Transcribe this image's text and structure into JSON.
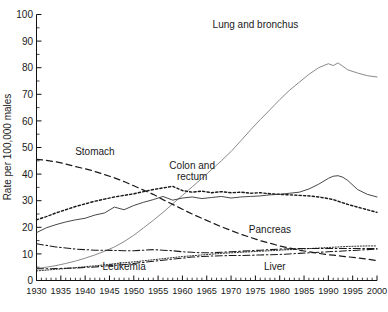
{
  "chart_data": {
    "type": "line",
    "title": "",
    "xlabel": "",
    "ylabel": "Rate per 100,000 males",
    "xlim": [
      1930,
      2000
    ],
    "ylim": [
      0,
      100
    ],
    "ytick_values": [
      0,
      10,
      20,
      30,
      40,
      50,
      60,
      70,
      80,
      90,
      100
    ],
    "ytick_labels": [
      "0",
      "10",
      "20",
      "30",
      "40",
      "50",
      "60",
      "70",
      "80",
      "90",
      "100"
    ],
    "xtick_values": [
      1930,
      1935,
      1940,
      1945,
      1950,
      1955,
      1960,
      1965,
      1970,
      1975,
      1980,
      1985,
      1990,
      1995,
      2000
    ],
    "xtick_labels": [
      "1930",
      "1935",
      "1940",
      "1945",
      "1950",
      "1955",
      "1960",
      "1965",
      "1970",
      "1975",
      "1980",
      "1985",
      "1990",
      "1995",
      "2000"
    ],
    "minor_tick_interval": 1,
    "grid": false,
    "legend": "inline-annotations",
    "x": [
      1930,
      1932,
      1934,
      1936,
      1938,
      1940,
      1942,
      1944,
      1946,
      1948,
      1950,
      1952,
      1954,
      1956,
      1958,
      1960,
      1962,
      1964,
      1966,
      1968,
      1970,
      1972,
      1974,
      1976,
      1978,
      1980,
      1982,
      1984,
      1986,
      1988,
      1990,
      1991,
      1992,
      1993,
      1994,
      1996,
      1998,
      2000
    ],
    "series": [
      {
        "name": "Lung and bronchus",
        "style": "solid-light",
        "label": "Lung and bronchus",
        "label_x": 1975,
        "label_y": 95,
        "values": [
          4.5,
          5.0,
          5.6,
          6.4,
          7.3,
          8.4,
          9.6,
          11.0,
          12.6,
          14.6,
          17.0,
          19.8,
          22.6,
          25.6,
          28.8,
          32.0,
          35.2,
          38.4,
          41.7,
          45.0,
          48.5,
          52.5,
          56.6,
          60.5,
          64.2,
          68.0,
          71.5,
          74.5,
          77.5,
          80.0,
          81.5,
          80.8,
          81.8,
          80.5,
          79.2,
          78.0,
          77.0,
          76.5
        ]
      },
      {
        "name": "Stomach",
        "style": "dashed",
        "label": "Stomach",
        "label_x": 1942,
        "label_y": 47,
        "values": [
          45.5,
          45.2,
          44.6,
          43.8,
          42.8,
          42.0,
          41.0,
          39.8,
          38.6,
          37.2,
          35.6,
          34.0,
          32.4,
          30.4,
          28.6,
          26.8,
          25.0,
          23.4,
          21.8,
          20.2,
          18.8,
          17.4,
          16.2,
          15.0,
          14.0,
          13.0,
          12.2,
          11.4,
          10.8,
          10.2,
          9.7,
          9.5,
          9.3,
          9.1,
          8.9,
          8.5,
          8.0,
          7.5
        ]
      },
      {
        "name": "Colon and rectum",
        "style": "dotted-thick",
        "label": "Colon and rectum",
        "label_x": 1962,
        "label_y": 42,
        "values": [
          22.8,
          24.0,
          25.4,
          26.6,
          27.8,
          28.8,
          29.8,
          30.6,
          31.4,
          32.0,
          32.6,
          33.4,
          34.2,
          34.8,
          35.4,
          33.8,
          33.2,
          33.6,
          33.0,
          33.4,
          33.0,
          33.2,
          32.8,
          33.0,
          32.6,
          32.4,
          32.2,
          32.0,
          31.8,
          31.4,
          30.8,
          30.4,
          29.8,
          29.2,
          28.6,
          27.6,
          26.6,
          25.6
        ]
      },
      {
        "name": "Prostate",
        "style": "solid-dark",
        "label": "",
        "label_x": null,
        "label_y": null,
        "values": [
          18.0,
          19.8,
          21.0,
          22.0,
          22.8,
          23.4,
          24.6,
          25.4,
          27.6,
          26.6,
          28.2,
          29.4,
          30.4,
          31.6,
          30.2,
          31.0,
          31.4,
          30.8,
          31.2,
          31.6,
          31.0,
          31.4,
          31.6,
          31.8,
          32.2,
          32.4,
          32.8,
          33.2,
          34.4,
          36.2,
          38.4,
          39.2,
          39.4,
          38.8,
          37.6,
          34.2,
          32.4,
          31.4
        ]
      },
      {
        "name": "Pancreas",
        "style": "dash-dot",
        "label": "Pancreas",
        "label_x": 1978,
        "label_y": 18,
        "values": [
          13.8,
          13.2,
          12.6,
          12.2,
          11.8,
          11.6,
          11.4,
          11.4,
          11.3,
          11.2,
          11.2,
          11.4,
          11.6,
          11.4,
          11.2,
          10.8,
          10.6,
          10.4,
          10.4,
          10.6,
          10.8,
          11.0,
          11.2,
          11.4,
          11.6,
          11.8,
          11.9,
          12.0,
          12.0,
          12.0,
          12.0,
          12.0,
          12.0,
          12.0,
          12.0,
          12.0,
          12.0,
          12.0
        ]
      },
      {
        "name": "Leukemia",
        "style": "dotted-fine",
        "label": "Leukemia",
        "label_x": 1948,
        "label_y": 4,
        "values": [
          3.6,
          3.9,
          4.2,
          4.5,
          4.8,
          5.2,
          5.5,
          5.9,
          6.3,
          6.7,
          7.0,
          7.4,
          7.8,
          8.2,
          8.6,
          9.0,
          9.3,
          9.6,
          9.9,
          10.2,
          10.4,
          10.6,
          10.8,
          11.0,
          11.2,
          11.4,
          11.6,
          11.8,
          12.0,
          12.2,
          12.4,
          12.5,
          12.6,
          12.7,
          12.8,
          12.9,
          13.0,
          13.0
        ]
      },
      {
        "name": "Liver",
        "style": "dash-dot",
        "label": "Liver",
        "label_x": 1979,
        "label_y": 4,
        "values": [
          4.4,
          4.4,
          4.5,
          4.6,
          4.7,
          4.9,
          5.1,
          5.4,
          5.7,
          6.0,
          6.4,
          6.8,
          7.2,
          7.6,
          8.0,
          8.4,
          8.8,
          9.0,
          9.2,
          9.3,
          9.4,
          9.4,
          9.5,
          9.6,
          9.7,
          9.8,
          10.0,
          10.2,
          10.4,
          10.6,
          10.8,
          10.9,
          11.0,
          11.1,
          11.2,
          11.4,
          11.6,
          11.8
        ]
      }
    ]
  }
}
